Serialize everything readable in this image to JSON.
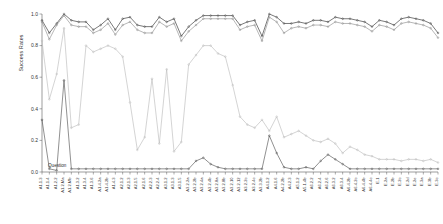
{
  "chart_data": {
    "type": "line",
    "title": "",
    "xlabel": "Question",
    "ylabel": "Success Rates",
    "ylim": [
      0.0,
      1.0
    ],
    "yticks": [
      "0.0",
      "0.2",
      "0.4",
      "0.6",
      "0.8",
      "1.0"
    ],
    "ytick_values": [
      0.0,
      0.2,
      0.4,
      0.6,
      0.8,
      1.0
    ],
    "grid": false,
    "legend": "none",
    "categories": [
      "A1.1.3",
      "A1.1.4",
      "A1.2.2",
      "A1.2.Ma",
      "A1.2.Mb",
      "A1.3.2",
      "A1.3.4",
      "A1.3.6",
      "A1.4.2a",
      "A1.4.2b",
      "A1.4.3",
      "A2.1.2",
      "A2.1.3",
      "A2.1.5",
      "A2.1.6",
      "A2.2.3",
      "A2.2.4",
      "A3.1.2",
      "A3.1.3",
      "A3.1.5",
      "A3.2.2a",
      "A3.2.2b",
      "A3.2.4a",
      "A3.2.4b",
      "A3.2.8a",
      "A3.2.8b",
      "A3.2.10",
      "A3.2.12",
      "A3.2.2c",
      "A3.2.4c",
      "A3.3.2b",
      "A4.1.2",
      "A4.1.6",
      "A4.2.2b",
      "A4.2.3",
      "A5.1.2",
      "A5.1.4b",
      "A6.2.2",
      "A6.2.4",
      "A6.2.6",
      "A6.3.2",
      "A6.3.4",
      "A6.4.2b",
      "A6.4.2c",
      "A6.4.4b",
      "A6.4.4c",
      "E.1",
      "E.2a",
      "E.2b",
      "E.2c",
      "E.2d",
      "E.2e",
      "E.3a",
      "E.3b",
      "E.3c"
    ],
    "series": [
      {
        "name": "series-1",
        "color": "#4d4d4d",
        "marker": "circle",
        "values": [
          0.96,
          0.88,
          0.94,
          1.0,
          0.96,
          0.95,
          0.95,
          0.9,
          0.93,
          0.97,
          0.9,
          0.97,
          0.98,
          0.93,
          0.92,
          0.92,
          0.98,
          0.95,
          0.97,
          0.86,
          0.92,
          0.96,
          0.99,
          0.99,
          0.99,
          0.99,
          0.99,
          0.93,
          0.95,
          0.96,
          0.86,
          1.0,
          0.98,
          0.94,
          0.94,
          0.95,
          0.94,
          0.96,
          0.96,
          0.95,
          0.98,
          0.97,
          0.97,
          0.96,
          0.95,
          0.92,
          0.96,
          0.95,
          0.93,
          0.97,
          0.98,
          0.97,
          0.96,
          0.94,
          0.88
        ]
      },
      {
        "name": "series-2",
        "color": "#8f8f8f",
        "marker": "circle",
        "values": [
          0.95,
          0.84,
          0.93,
          0.99,
          0.93,
          0.92,
          0.92,
          0.88,
          0.9,
          0.94,
          0.87,
          0.93,
          0.95,
          0.9,
          0.88,
          0.88,
          0.95,
          0.92,
          0.94,
          0.83,
          0.89,
          0.93,
          0.97,
          0.97,
          0.97,
          0.97,
          0.97,
          0.9,
          0.92,
          0.93,
          0.83,
          0.98,
          0.95,
          0.88,
          0.91,
          0.92,
          0.91,
          0.93,
          0.93,
          0.92,
          0.95,
          0.94,
          0.94,
          0.93,
          0.92,
          0.89,
          0.93,
          0.92,
          0.9,
          0.94,
          0.95,
          0.94,
          0.93,
          0.91,
          0.85
        ]
      },
      {
        "name": "series-3",
        "color": "#bcbcbc",
        "marker": "circle",
        "values": [
          0.83,
          0.46,
          0.62,
          0.91,
          0.28,
          0.3,
          0.8,
          0.76,
          0.78,
          0.8,
          0.78,
          0.73,
          0.44,
          0.14,
          0.22,
          0.59,
          0.18,
          0.65,
          0.13,
          0.19,
          0.68,
          0.74,
          0.8,
          0.8,
          0.75,
          0.73,
          0.55,
          0.35,
          0.3,
          0.28,
          0.33,
          0.26,
          0.35,
          0.22,
          0.24,
          0.26,
          0.23,
          0.2,
          0.19,
          0.21,
          0.18,
          0.12,
          0.16,
          0.14,
          0.11,
          0.1,
          0.08,
          0.08,
          0.08,
          0.07,
          0.08,
          0.08,
          0.07,
          0.08,
          0.06
        ]
      },
      {
        "name": "series-4",
        "color": "#555555",
        "marker": "circle",
        "values": [
          0.33,
          0.02,
          0.01,
          0.58,
          0.02,
          0.02,
          0.02,
          0.02,
          0.02,
          0.02,
          0.02,
          0.02,
          0.02,
          0.02,
          0.02,
          0.02,
          0.02,
          0.02,
          0.02,
          0.02,
          0.02,
          0.07,
          0.09,
          0.05,
          0.03,
          0.02,
          0.02,
          0.02,
          0.02,
          0.02,
          0.02,
          0.23,
          0.12,
          0.03,
          0.02,
          0.02,
          0.03,
          0.02,
          0.07,
          0.11,
          0.08,
          0.05,
          0.02,
          0.02,
          0.02,
          0.02,
          0.02,
          0.02,
          0.02,
          0.02,
          0.02,
          0.02,
          0.02,
          0.02,
          0.02
        ]
      }
    ]
  }
}
